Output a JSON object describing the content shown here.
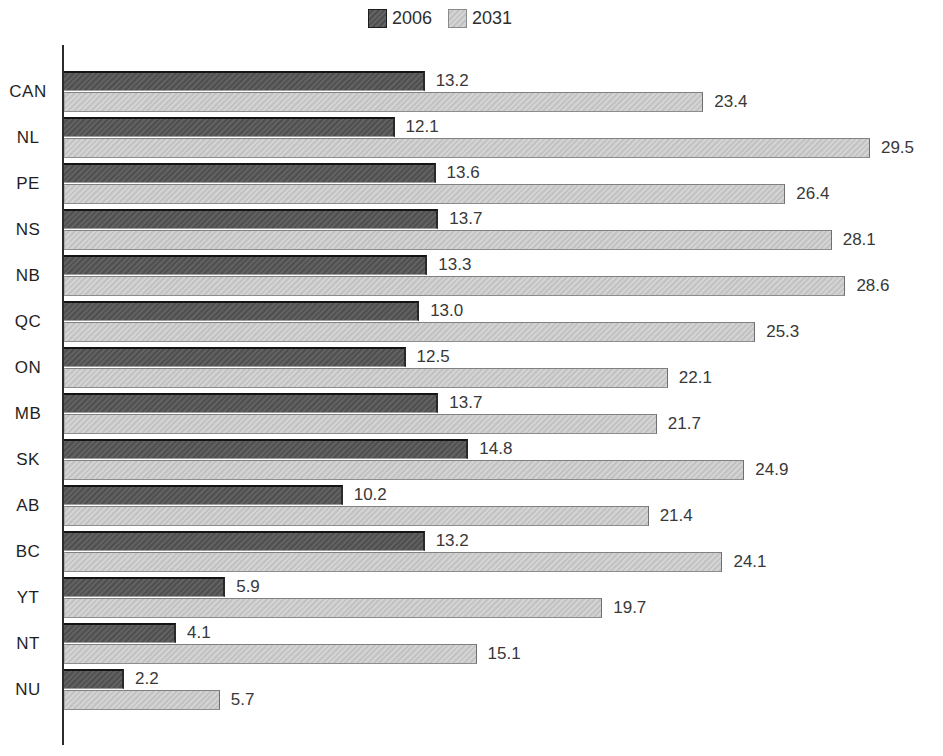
{
  "page": {
    "background": "#ffffff"
  },
  "legend": {
    "position": "top-center"
  },
  "chart_data": {
    "type": "bar",
    "orientation": "horizontal",
    "title": "",
    "xlabel": "",
    "ylabel": "",
    "categories": [
      "CAN",
      "NL",
      "PE",
      "NS",
      "NB",
      "QC",
      "ON",
      "MB",
      "SK",
      "AB",
      "BC",
      "YT",
      "NT",
      "NU"
    ],
    "series": [
      {
        "name": "2006",
        "color": "#585858",
        "values": [
          13.2,
          12.1,
          13.6,
          13.7,
          13.3,
          13.0,
          12.5,
          13.7,
          14.8,
          10.2,
          13.2,
          5.9,
          4.1,
          2.2
        ],
        "labels": [
          "13.2",
          "12.1",
          "13.6",
          "13.7",
          "13.3",
          "13.0",
          "12.5",
          "13.7",
          "14.8",
          "10.2",
          "13.2",
          "5.9",
          "4.1",
          "2.2"
        ]
      },
      {
        "name": "2031",
        "color": "#cccccc",
        "values": [
          23.4,
          29.5,
          26.4,
          28.1,
          28.6,
          25.3,
          22.1,
          21.7,
          24.9,
          21.4,
          24.1,
          19.7,
          15.1,
          5.7
        ],
        "labels": [
          "23.4",
          "29.5",
          "26.4",
          "28.1",
          "28.6",
          "25.3",
          "22.1",
          "21.7",
          "24.9",
          "21.4",
          "24.1",
          "19.7",
          "15.1",
          "5.7"
        ]
      }
    ],
    "xlim": [
      0,
      32.1
    ],
    "grid": false,
    "value_labels": true,
    "legend_position": "top",
    "axis_color": "#2b2b2b"
  }
}
